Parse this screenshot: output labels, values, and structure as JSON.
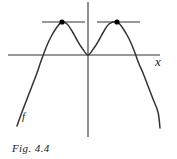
{
  "figure": {
    "caption": "Fig. 4.4",
    "x_axis_label": "x",
    "curve_label": "f",
    "stroke_color": "#333333",
    "point_color": "#000000",
    "background_color": "#ffffff"
  },
  "chart_data": {
    "type": "line",
    "title": "Fig. 4.4",
    "xlabel": "x",
    "ylabel": "",
    "grid": false,
    "legend": null,
    "axes": {
      "x_axis_y_px": 55,
      "x_axis_from_px": 8,
      "x_axis_to_px": 160,
      "y_axis_x_px": 88,
      "y_axis_from_px": 2,
      "y_axis_to_px": 137
    },
    "series": [
      {
        "name": "f",
        "description": "W-shaped quartic curve opening downward at both ends, with two equal local maxima and a local minimum at the origin",
        "points_px": [
          [
            17,
            126
          ],
          [
            22,
            112
          ],
          [
            27,
            99
          ],
          [
            32,
            86
          ],
          [
            37,
            73
          ],
          [
            40,
            64
          ],
          [
            44,
            53
          ],
          [
            48,
            43
          ],
          [
            52,
            35
          ],
          [
            57,
            27
          ],
          [
            62,
            22
          ],
          [
            67,
            24
          ],
          [
            72,
            31
          ],
          [
            77,
            40
          ],
          [
            82,
            48
          ],
          [
            88,
            55
          ],
          [
            94,
            48
          ],
          [
            99,
            40
          ],
          [
            104,
            31
          ],
          [
            109,
            24
          ],
          [
            117,
            22
          ],
          [
            122,
            27
          ],
          [
            127,
            35
          ],
          [
            131,
            43
          ],
          [
            135,
            53
          ],
          [
            139,
            64
          ],
          [
            143,
            73
          ],
          [
            148,
            86
          ],
          [
            153,
            99
          ],
          [
            158,
            112
          ],
          [
            160,
            128
          ]
        ],
        "x_intercepts_px": [
          40,
          136
        ]
      }
    ],
    "annotations": [
      {
        "type": "tangent-line",
        "name": "left-tangent",
        "orientation": "horizontal",
        "y_px": 22,
        "x_from_px": 42,
        "x_to_px": 85
      },
      {
        "type": "tangent-line",
        "name": "right-tangent",
        "orientation": "horizontal",
        "y_px": 22,
        "x_from_px": 97,
        "x_to_px": 140
      },
      {
        "type": "point",
        "name": "left-maximum",
        "x_px": 62,
        "y_px": 22,
        "filled": true
      },
      {
        "type": "point",
        "name": "right-maximum",
        "x_px": 117,
        "y_px": 22,
        "filled": true
      }
    ]
  }
}
